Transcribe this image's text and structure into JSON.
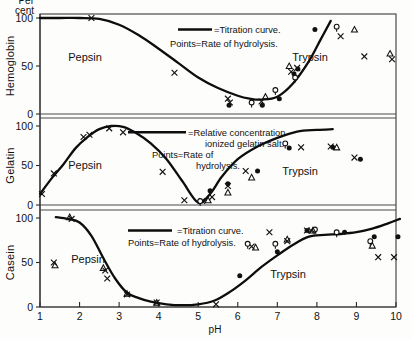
{
  "figure": {
    "x_axis": {
      "label": "pH",
      "ticks": [
        "1",
        "2",
        "3",
        "4",
        "5",
        "6",
        "7",
        "8",
        "9",
        "10"
      ],
      "min": 1,
      "max": 10
    },
    "y_axis": {
      "unit_line1": "Per",
      "unit_line2": "cent",
      "ticks": [
        "0",
        "50",
        "100"
      ],
      "min": 0,
      "max": 100
    },
    "panels": [
      {
        "name": "hemoglobin",
        "ylabel": "Hemoglobin",
        "region_left": "Pepsin",
        "region_right": "Trypsin",
        "legend_line1": "=Titration curve.",
        "legend_line2": "Points=Rate of hydrolysis."
      },
      {
        "name": "gelatin",
        "ylabel": "Gelatin",
        "region_left": "Pepsin",
        "region_right": "Trypsin",
        "legend_line1": "=Relative concentration",
        "legend_line2": "ionized gelatin salt.",
        "legend_line3": "Points=Rate of",
        "legend_line4": "hydrolysis."
      },
      {
        "name": "casein",
        "ylabel": "Casein",
        "region_left": "Pepsin",
        "region_right": "Trypsin",
        "legend_line1": "=Titration curve.",
        "legend_line2": "Points=Rate of hydrolysis."
      }
    ]
  },
  "chart_data": [
    {
      "type": "line",
      "title": "Hemoglobin",
      "xlabel": "pH",
      "ylabel": "Per cent",
      "xlim": [
        1,
        10
      ],
      "ylim": [
        0,
        100
      ],
      "grid": false,
      "legend": [
        "=Titration curve.",
        "Points=Rate of hydrolysis."
      ],
      "series": [
        {
          "name": "Titration curve",
          "style": "line",
          "x": [
            1.0,
            1.5,
            2.0,
            2.5,
            3.0,
            3.5,
            4.0,
            4.5,
            5.0,
            5.5,
            6.0,
            6.3,
            6.6,
            7.0,
            7.4,
            7.8,
            8.1,
            8.35
          ],
          "y": [
            100,
            100,
            100,
            99,
            93,
            82,
            68,
            53,
            38,
            27,
            19,
            16,
            15,
            18,
            32,
            55,
            78,
            97
          ]
        },
        {
          "name": "Rate of hydrolysis (x)",
          "style": "scatter",
          "marker": "x",
          "x": [
            2.3,
            4.4,
            5.75,
            5.8,
            6.6,
            7.35,
            7.5,
            8.6,
            9.2,
            9.9
          ],
          "y": [
            100,
            43,
            16,
            12,
            13,
            44,
            48,
            81,
            60,
            57
          ]
        },
        {
          "name": "Rate of hydrolysis (filled circle)",
          "style": "scatter",
          "marker": "filled-circle",
          "x": [
            5.78,
            6.62,
            7.05,
            7.42,
            7.52,
            7.95
          ],
          "y": [
            9,
            9,
            16,
            42,
            47,
            88
          ]
        },
        {
          "name": "Rate of hydrolysis (open circle)",
          "style": "scatter",
          "marker": "open-circle",
          "x": [
            6.35,
            6.95,
            7.45,
            8.5
          ],
          "y": [
            12,
            25,
            38,
            91
          ]
        },
        {
          "name": "Rate of hydrolysis (triangle)",
          "style": "scatter",
          "marker": "triangle",
          "x": [
            6.7,
            7.3,
            8.95,
            9.85
          ],
          "y": [
            18,
            50,
            88,
            63
          ]
        }
      ]
    },
    {
      "type": "line",
      "title": "Gelatin",
      "xlabel": "pH",
      "ylabel": "Per cent",
      "xlim": [
        1,
        10
      ],
      "ylim": [
        0,
        100
      ],
      "grid": false,
      "legend": [
        "=Relative concentration ionized gelatin salt.",
        "Points=Rate of hydrolysis"
      ],
      "series": [
        {
          "name": "Relative concentration ionized gelatin salt",
          "style": "line",
          "x": [
            1.0,
            1.3,
            1.6,
            1.9,
            2.2,
            2.5,
            2.8,
            3.1,
            3.4,
            3.8,
            4.2,
            4.6,
            5.0,
            5.3,
            5.6,
            6.0,
            6.5,
            7.0,
            7.5,
            8.0,
            8.4
          ],
          "y": [
            14,
            34,
            52,
            72,
            86,
            96,
            100,
            99,
            92,
            78,
            58,
            30,
            3,
            14,
            36,
            58,
            74,
            85,
            93,
            95,
            96
          ]
        },
        {
          "name": "Rate of hydrolysis (x)",
          "style": "scatter",
          "marker": "x",
          "x": [
            1.05,
            1.35,
            2.1,
            2.25,
            2.75,
            3.1,
            4.1,
            4.65,
            5.1,
            5.35,
            5.75,
            6.2,
            7.6,
            8.35,
            8.95
          ],
          "y": [
            14,
            40,
            86,
            89,
            97,
            92,
            42,
            6,
            5,
            10,
            24,
            43,
            73,
            74,
            60
          ]
        },
        {
          "name": "Rate of hydrolysis (filled circle)",
          "style": "scatter",
          "marker": "filled-circle",
          "x": [
            5.3,
            5.75,
            6.5,
            7.3,
            8.4,
            9.1
          ],
          "y": [
            18,
            27,
            43,
            72,
            73,
            58
          ]
        },
        {
          "name": "Rate of hydrolysis (open circle)",
          "style": "scatter",
          "marker": "open-circle",
          "x": [
            5.05,
            7.2
          ],
          "y": [
            5,
            78
          ]
        },
        {
          "name": "Rate of hydrolysis (triangle)",
          "style": "scatter",
          "marker": "triangle",
          "x": [
            5.25,
            5.75,
            6.35,
            8.5
          ],
          "y": [
            6,
            16,
            35,
            73
          ]
        }
      ]
    },
    {
      "type": "line",
      "title": "Casein",
      "xlabel": "pH",
      "ylabel": "Per cent",
      "xlim": [
        1,
        10
      ],
      "ylim": [
        0,
        100
      ],
      "grid": false,
      "legend": [
        "=Titration curve.",
        "Points=Rate of hydrolysis."
      ],
      "series": [
        {
          "name": "Titration curve",
          "style": "line",
          "x": [
            1.4,
            1.7,
            2.0,
            2.3,
            2.6,
            2.9,
            3.2,
            3.5,
            3.8,
            4.2,
            4.6,
            5.0,
            5.4,
            5.8,
            6.2,
            6.6,
            7.0,
            7.4,
            7.8,
            8.2,
            8.6,
            9.0,
            9.4,
            9.8,
            10.1
          ],
          "y": [
            101,
            99,
            95,
            80,
            55,
            32,
            16,
            10,
            6,
            3,
            2,
            3,
            7,
            17,
            30,
            45,
            58,
            70,
            79,
            81,
            82,
            84,
            88,
            94,
            99
          ]
        },
        {
          "name": "Rate of hydrolysis (x)",
          "style": "scatter",
          "marker": "x",
          "x": [
            1.35,
            1.8,
            2.65,
            2.7,
            3.2,
            3.95,
            5.45,
            6.35,
            6.8,
            7.25,
            7.75,
            7.85,
            9.55,
            9.95
          ],
          "y": [
            50,
            99,
            41,
            32,
            14,
            5,
            3,
            68,
            84,
            74,
            86,
            86,
            56,
            56
          ]
        },
        {
          "name": "Rate of hydrolysis (filled circle)",
          "style": "scatter",
          "marker": "filled-circle",
          "x": [
            6.05,
            7.0,
            7.75,
            8.7,
            9.45,
            10.05
          ],
          "y": [
            35,
            62,
            86,
            84,
            79,
            79
          ]
        },
        {
          "name": "Rate of hydrolysis (open circle)",
          "style": "scatter",
          "marker": "open-circle",
          "x": [
            6.25,
            6.95,
            7.95,
            8.5,
            9.35
          ],
          "y": [
            71,
            71,
            87,
            84,
            74
          ]
        },
        {
          "name": "Rate of hydrolysis (triangle)",
          "style": "scatter",
          "marker": "triangle",
          "x": [
            1.38,
            1.75,
            2.6,
            3.2,
            3.95,
            6.45,
            7.25,
            7.9,
            9.4
          ],
          "y": [
            47,
            101,
            44,
            15,
            5,
            67,
            76,
            86,
            69
          ]
        }
      ]
    }
  ]
}
